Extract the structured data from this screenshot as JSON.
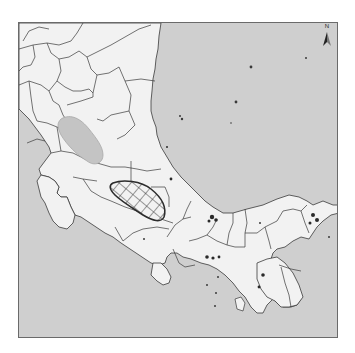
{
  "map": {
    "type": "reference map",
    "region_extent": "Southern Nicaragua, Costa Rica and Panama",
    "colors": {
      "sea": "#cfcfcf",
      "land": "#f2f2f2",
      "boundary": "#3a3a3a",
      "shaded_region": "#c4c4c4",
      "hatched_region_outline": "#2c2c2c",
      "frame": "#6a6a6a"
    },
    "features": [
      {
        "name": "shaded-region",
        "style": "solid gray fill",
        "location": "southern Nicaragua"
      },
      {
        "name": "hatched-region",
        "style": "crosshatch fill",
        "location": "central Costa Rica"
      }
    ],
    "north_arrow": {
      "label": "N"
    }
  }
}
